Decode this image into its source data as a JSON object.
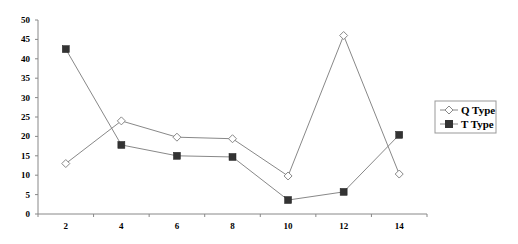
{
  "chart_data": {
    "type": "line",
    "title": "",
    "xlabel": "",
    "ylabel": "",
    "categories": [
      "2",
      "4",
      "6",
      "8",
      "10",
      "12",
      "14"
    ],
    "x": [
      2,
      4,
      6,
      8,
      10,
      12,
      14
    ],
    "ylim": [
      0,
      50
    ],
    "yticks": [
      0,
      5,
      10,
      15,
      20,
      25,
      30,
      35,
      40,
      45,
      50
    ],
    "grid": false,
    "legend_position": "right",
    "series": [
      {
        "name": "Q Type",
        "marker": "diamond-open",
        "color": "#888888",
        "values": [
          13,
          24,
          19.8,
          19.4,
          9.8,
          46,
          10.3
        ]
      },
      {
        "name": "T Type",
        "marker": "square-filled",
        "color": "#333333",
        "values": [
          42.5,
          17.8,
          15,
          14.7,
          3.6,
          5.7,
          20.4
        ]
      }
    ]
  },
  "legend": {
    "items": [
      {
        "label": "Q Type"
      },
      {
        "label": "T Type"
      }
    ]
  }
}
